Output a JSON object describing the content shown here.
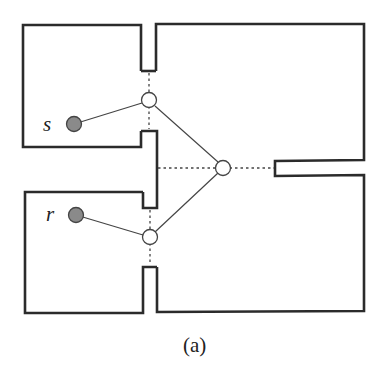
{
  "figure": {
    "caption": "(a)",
    "labels": {
      "source": "s",
      "receiver": "r"
    },
    "colors": {
      "wall": "#2b2b2b",
      "edge": "#444444",
      "filled_node": "#8a8a8a",
      "open_node": "#ffffff",
      "background": "#ffffff"
    },
    "nodes": [
      {
        "id": "s",
        "type": "filled",
        "label": "s"
      },
      {
        "id": "r",
        "type": "filled",
        "label": "r"
      },
      {
        "id": "top-doorway",
        "type": "open"
      },
      {
        "id": "center-junction",
        "type": "open"
      },
      {
        "id": "bottom-doorway",
        "type": "open"
      }
    ],
    "edges": [
      {
        "from": "s",
        "to": "top-doorway",
        "style": "solid"
      },
      {
        "from": "r",
        "to": "bottom-doorway",
        "style": "solid"
      },
      {
        "from": "top-doorway",
        "to": "center-junction",
        "style": "solid"
      },
      {
        "from": "bottom-doorway",
        "to": "center-junction",
        "style": "solid"
      }
    ],
    "rooms": [
      "top-left-room",
      "bottom-left-room",
      "right-room"
    ]
  }
}
